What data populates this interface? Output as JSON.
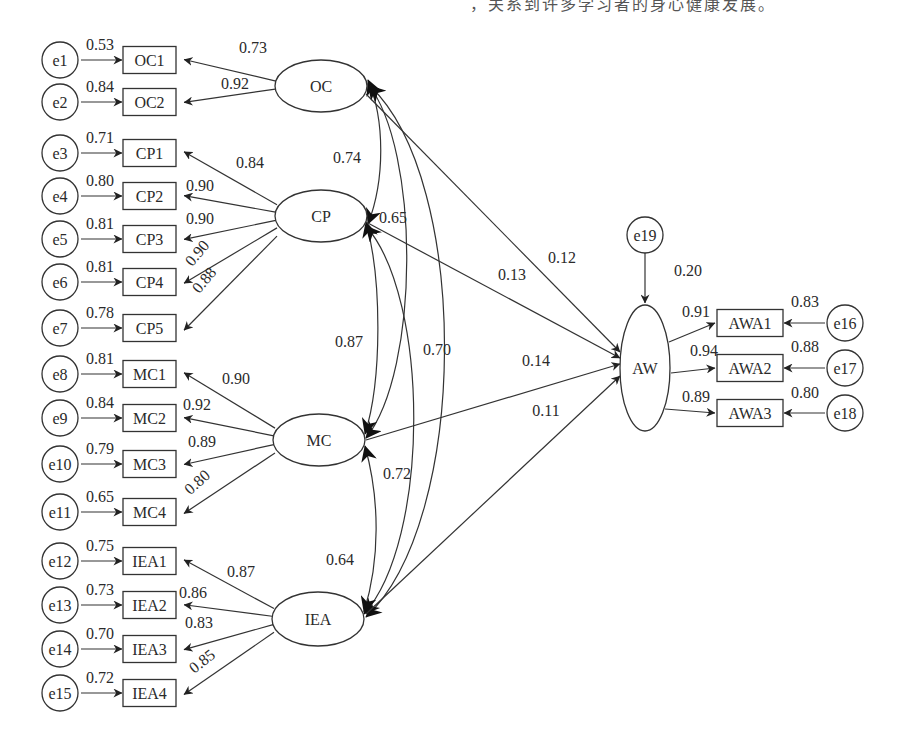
{
  "header": {
    "cropped_text": "，关系到许多学习者的身心健康发展。"
  },
  "diagram": {
    "type": "structural-equation-model",
    "latents": [
      {
        "id": "OC",
        "label": "OC",
        "cx": 321,
        "cy": 86,
        "rx": 46,
        "ry": 26
      },
      {
        "id": "CP",
        "label": "CP",
        "cx": 321,
        "cy": 216,
        "rx": 46,
        "ry": 26
      },
      {
        "id": "MC",
        "label": "MC",
        "cx": 319,
        "cy": 440,
        "rx": 46,
        "ry": 26
      },
      {
        "id": "IEA",
        "label": "IEA",
        "cx": 318,
        "cy": 619,
        "rx": 46,
        "ry": 27
      },
      {
        "id": "AW",
        "label": "AW",
        "cx": 645,
        "cy": 368,
        "rx": 25,
        "ry": 63
      }
    ],
    "indicators": [
      {
        "label": "OC1",
        "error": "e1",
        "error_loading": "0.53",
        "factor": "OC",
        "loading": "0.73",
        "y": 60
      },
      {
        "label": "OC2",
        "error": "e2",
        "error_loading": "0.84",
        "factor": "OC",
        "loading": "0.92",
        "y": 102
      },
      {
        "label": "CP1",
        "error": "e3",
        "error_loading": "0.71",
        "factor": "CP",
        "loading": "0.84",
        "y": 153
      },
      {
        "label": "CP2",
        "error": "e4",
        "error_loading": "0.80",
        "factor": "CP",
        "loading": "0.90",
        "y": 196
      },
      {
        "label": "CP3",
        "error": "e5",
        "error_loading": "0.81",
        "factor": "CP",
        "loading": "0.90",
        "y": 239
      },
      {
        "label": "CP4",
        "error": "e6",
        "error_loading": "0.81",
        "factor": "CP",
        "loading": "0.90",
        "y": 282
      },
      {
        "label": "CP5",
        "error": "e7",
        "error_loading": "0.78",
        "factor": "CP",
        "loading": "0.88",
        "y": 328
      },
      {
        "label": "MC1",
        "error": "e8",
        "error_loading": "0.81",
        "factor": "MC",
        "loading": "0.90",
        "y": 374
      },
      {
        "label": "MC2",
        "error": "e9",
        "error_loading": "0.84",
        "factor": "MC",
        "loading": "0.92",
        "y": 418
      },
      {
        "label": "MC3",
        "error": "e10",
        "error_loading": "0.79",
        "factor": "MC",
        "loading": "0.89",
        "y": 464
      },
      {
        "label": "MC4",
        "error": "e11",
        "error_loading": "0.65",
        "factor": "MC",
        "loading": "0.80",
        "y": 512
      },
      {
        "label": "IEA1",
        "error": "e12",
        "error_loading": "0.75",
        "factor": "IEA",
        "loading": "0.87",
        "y": 561
      },
      {
        "label": "IEA2",
        "error": "e13",
        "error_loading": "0.73",
        "factor": "IEA",
        "loading": "0.86",
        "y": 605
      },
      {
        "label": "IEA3",
        "error": "e14",
        "error_loading": "0.70",
        "factor": "IEA",
        "loading": "0.83",
        "y": 649
      },
      {
        "label": "IEA4",
        "error": "e15",
        "error_loading": "0.72",
        "factor": "IEA",
        "loading": "0.85",
        "y": 693
      }
    ],
    "outcome_indicators": [
      {
        "label": "AWA1",
        "error": "e16",
        "error_loading": "0.83",
        "loading": "0.91",
        "y": 323
      },
      {
        "label": "AWA2",
        "error": "e17",
        "error_loading": "0.88",
        "loading": "0.94",
        "y": 368
      },
      {
        "label": "AWA3",
        "error": "e18",
        "error_loading": "0.80",
        "loading": "0.89",
        "y": 413
      }
    ],
    "disturbance": {
      "label": "e19",
      "target": "AW",
      "value": "0.20"
    },
    "correlations": [
      {
        "from": "OC",
        "to": "CP",
        "value": "0.74"
      },
      {
        "from": "OC",
        "to": "MC",
        "value": "0.65"
      },
      {
        "from": "OC",
        "to": "IEA",
        "value": "0.70"
      },
      {
        "from": "CP",
        "to": "MC",
        "value": "0.87"
      },
      {
        "from": "CP",
        "to": "IEA",
        "value": "0.72"
      },
      {
        "from": "MC",
        "to": "IEA",
        "value": "0.64"
      }
    ],
    "paths": [
      {
        "from": "OC",
        "to": "AW",
        "value": "0.12"
      },
      {
        "from": "CP",
        "to": "AW",
        "value": "0.13"
      },
      {
        "from": "MC",
        "to": "AW",
        "value": "0.14"
      },
      {
        "from": "IEA",
        "to": "AW",
        "value": "0.11"
      }
    ]
  }
}
